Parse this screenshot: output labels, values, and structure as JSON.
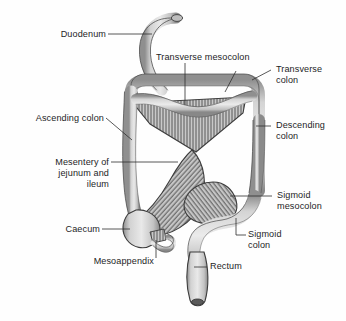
{
  "figure": {
    "background_color": "#fefefe",
    "line_color": "#3a3a3a",
    "text_color": "#1d1d1f",
    "organ_fill": "#c9c9c9",
    "mesentery_fill": "#c4c4c4",
    "hatch_color": "#4a4a4a"
  },
  "labels": {
    "duodenum": "Duodenum",
    "transverse_mesocolon": "Transverse mesocolon",
    "transverse_colon_l1": "Transverse",
    "transverse_colon_l2": "colon",
    "ascending_colon": "Ascending colon",
    "descending_colon_l1": "Descending",
    "descending_colon_l2": "colon",
    "mesentery_l1": "Mesentery of",
    "mesentery_l2": "jejunum and",
    "mesentery_l3": "ileum",
    "sigmoid_mesocolon_l1": "Sigmoid",
    "sigmoid_mesocolon_l2": "mesocolon",
    "caecum": "Caecum",
    "sigmoid_colon_l1": "Sigmoid",
    "sigmoid_colon_l2": "colon",
    "mesoappendix": "Mesoappendix",
    "rectum": "Rectum"
  },
  "structures": [
    "duodenum",
    "transverse colon",
    "transverse mesocolon",
    "ascending colon",
    "descending colon",
    "mesentery of jejunum and ileum",
    "caecum",
    "mesoappendix",
    "sigmoid colon",
    "sigmoid mesocolon",
    "rectum"
  ]
}
